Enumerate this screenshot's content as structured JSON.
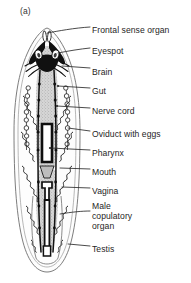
{
  "figure": {
    "panel_label": "(a)",
    "background_color": "#ffffff",
    "ink_color": "#1a1a1a",
    "gut_fill_color": "#cfcfcf",
    "body_fill_color": "#fdfdfd"
  },
  "labels": [
    {
      "id": "frontal-sense-organ",
      "text": "Frontal sense organ",
      "x": 92,
      "y": 25
    },
    {
      "id": "eyespot",
      "text": "Eyespot",
      "x": 92,
      "y": 46
    },
    {
      "id": "brain",
      "text": "Brain",
      "x": 92,
      "y": 67
    },
    {
      "id": "gut",
      "text": "Gut",
      "x": 92,
      "y": 86
    },
    {
      "id": "nerve-cord",
      "text": "Nerve cord",
      "x": 92,
      "y": 106
    },
    {
      "id": "oviduct-with-eggs",
      "text": "Oviduct with eggs",
      "x": 92,
      "y": 129
    },
    {
      "id": "pharynx",
      "text": "Pharynx",
      "x": 92,
      "y": 148
    },
    {
      "id": "mouth",
      "text": "Mouth",
      "x": 92,
      "y": 167
    },
    {
      "id": "vagina",
      "text": "Vagina",
      "x": 92,
      "y": 186
    },
    {
      "id": "testis",
      "text": "Testis",
      "x": 92,
      "y": 244
    }
  ],
  "multiline_labels": [
    {
      "id": "male-copulatory-organ",
      "lines": [
        "Male",
        "copulatory",
        "organ"
      ],
      "x": 92,
      "y": 205
    }
  ]
}
